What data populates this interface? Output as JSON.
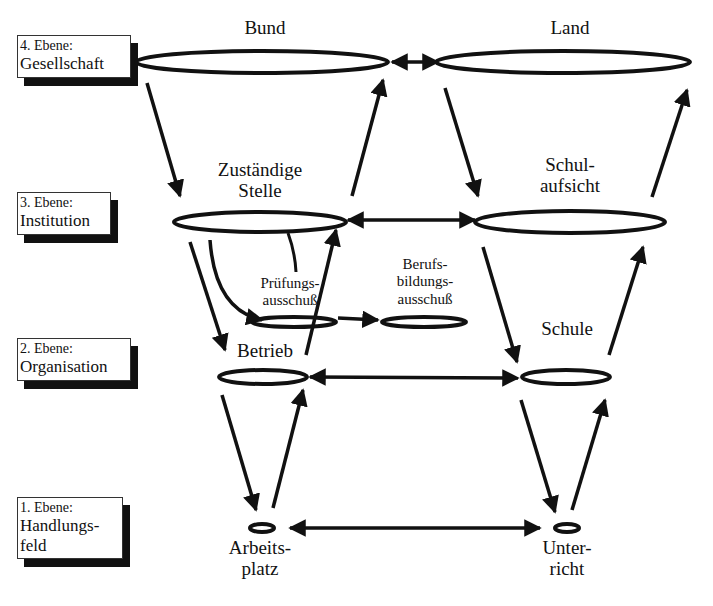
{
  "levels": [
    {
      "number": "4. Ebene:",
      "name": "Gesellschaft"
    },
    {
      "number": "3. Ebene:",
      "name": "Institution"
    },
    {
      "number": "2. Ebene:",
      "name": "Organisation"
    },
    {
      "number": "1. Ebene:",
      "name_line1": "Handlungs-",
      "name_line2": "feld"
    }
  ],
  "nodes": {
    "bund": "Bund",
    "land": "Land",
    "zustaendige_stelle": {
      "line1": "Zuständige",
      "line2": "Stelle"
    },
    "schulaufsicht": {
      "line1": "Schul-",
      "line2": "aufsicht"
    },
    "pruefungsausschuss": {
      "line1": "Prüfungs-",
      "line2": "ausschuß"
    },
    "berufsbildungsausschuss": {
      "line1": "Berufs-",
      "line2": "bildungs-",
      "line3": "ausschuß"
    },
    "betrieb": "Betrieb",
    "schule": "Schule",
    "arbeitsplatz": {
      "line1": "Arbeits-",
      "line2": "platz"
    },
    "unterricht": {
      "line1": "Unter-",
      "line2": "richt"
    }
  },
  "colors": {
    "ink": "#111111",
    "background": "#ffffff"
  }
}
